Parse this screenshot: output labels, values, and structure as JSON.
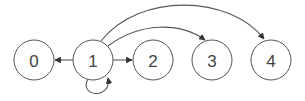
{
  "diagram": {
    "type": "directed-graph",
    "colors": {
      "stroke": "#555555",
      "text": "#444444",
      "background": "#ffffff"
    },
    "nodes": [
      {
        "id": "0",
        "label": "0",
        "cx": 34,
        "cy": 60
      },
      {
        "id": "1",
        "label": "1",
        "cx": 93,
        "cy": 60
      },
      {
        "id": "2",
        "label": "2",
        "cx": 153,
        "cy": 60
      },
      {
        "id": "3",
        "label": "3",
        "cx": 212,
        "cy": 60
      },
      {
        "id": "4",
        "label": "4",
        "cx": 271,
        "cy": 60
      }
    ],
    "edges": [
      {
        "from": "1",
        "to": "0",
        "kind": "straight"
      },
      {
        "from": "1",
        "to": "2",
        "kind": "straight"
      },
      {
        "from": "1",
        "to": "3",
        "kind": "arc"
      },
      {
        "from": "1",
        "to": "4",
        "kind": "arc"
      },
      {
        "from": "1",
        "to": "1",
        "kind": "self-loop"
      }
    ]
  }
}
